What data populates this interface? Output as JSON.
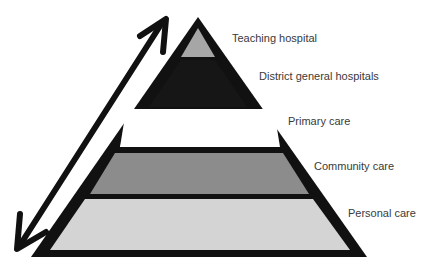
{
  "diagram": {
    "type": "pyramid",
    "levels": [
      {
        "label": "Teaching hospital",
        "fill": "#a6a6a6"
      },
      {
        "label": "District general hospitals",
        "fill": "#1a1a1a"
      },
      {
        "label": "Primary care",
        "fill": "#ffffff"
      },
      {
        "label": "Community care",
        "fill": "#8c8c8c"
      },
      {
        "label": "Personal care",
        "fill": "#d4d4d4"
      }
    ],
    "outline_color": "#111111",
    "arrow": {
      "direction": "bidirectional",
      "orientation": "diagonal"
    }
  }
}
